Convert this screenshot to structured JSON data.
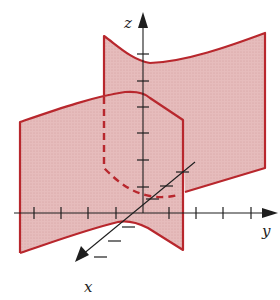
{
  "figure": {
    "colors": {
      "surface_fill": "#e3b6b6",
      "surface_edge": "#b8272d",
      "axis": "#1e1e1e",
      "background": "#ffffff"
    },
    "axes": {
      "x": {
        "label": "x",
        "ticks": 6
      },
      "y": {
        "label": "y",
        "ticks": 8
      },
      "z": {
        "label": "z",
        "ticks": 7
      }
    },
    "curves": {
      "intersection": {
        "style": "dashed"
      }
    }
  }
}
